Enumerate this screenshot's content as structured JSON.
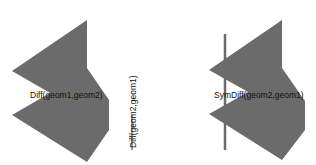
{
  "figures": [
    {
      "name": "diff-geom1-geom2",
      "label": "Diff(geom1,geom2)",
      "fill": "#6b6b6b"
    },
    {
      "name": "diff-geom2-geom1",
      "label": "Diff(geom2,geom1)",
      "stroke": "#333333"
    },
    {
      "name": "symdiff-geom2-geom1",
      "label": "SymDiff(geom2,geom1)",
      "fill": "#6b6b6b",
      "line_color": "#6b6b6b"
    }
  ]
}
